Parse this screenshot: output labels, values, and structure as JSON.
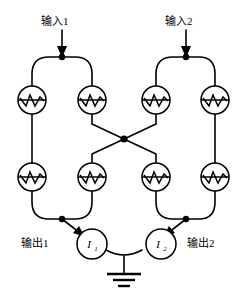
{
  "diagram": {
    "type": "circuit-schematic",
    "colors": {
      "wire": "#000000",
      "background": "#ffffff",
      "node": "#000000"
    },
    "inputs": [
      {
        "id": "input-1",
        "label": "输入1",
        "x": 90,
        "y": 25,
        "arrow_x": 62,
        "arrow_top": 30,
        "arrow_bottom": 56
      },
      {
        "id": "input-2",
        "label": "输入2",
        "x": 175,
        "y": 25,
        "arrow_x": 186,
        "arrow_top": 30,
        "arrow_bottom": 56
      }
    ],
    "outputs": [
      {
        "id": "output-1",
        "label": "输出1",
        "x": 22,
        "y": 236
      },
      {
        "id": "output-2",
        "label": "输出2",
        "x": 186,
        "y": 236
      }
    ],
    "current_sources": [
      {
        "id": "source-1",
        "symbol": "I",
        "subscript": "1",
        "cx": 92,
        "cy": 244,
        "r": 15
      },
      {
        "id": "source-2",
        "symbol": "I",
        "subscript": "2",
        "cx": 161,
        "cy": 244,
        "r": 15
      }
    ],
    "junctions": [
      {
        "id": "jj-1",
        "row": "upper",
        "loop": "left",
        "cx": 32,
        "cy": 100
      },
      {
        "id": "jj-2",
        "row": "upper",
        "loop": "left",
        "cx": 92,
        "cy": 100
      },
      {
        "id": "jj-3",
        "row": "upper",
        "loop": "right",
        "cx": 156,
        "cy": 100
      },
      {
        "id": "jj-4",
        "row": "upper",
        "loop": "right",
        "cx": 215,
        "cy": 100
      },
      {
        "id": "jj-5",
        "row": "lower",
        "loop": "left",
        "cx": 32,
        "cy": 177
      },
      {
        "id": "jj-6",
        "row": "lower",
        "loop": "left",
        "cx": 92,
        "cy": 177
      },
      {
        "id": "jj-7",
        "row": "lower",
        "loop": "right",
        "cx": 156,
        "cy": 177
      },
      {
        "id": "jj-8",
        "row": "lower",
        "loop": "right",
        "cx": 215,
        "cy": 177
      }
    ],
    "nodes": [
      {
        "id": "node-input-1",
        "x": 62,
        "y": 57
      },
      {
        "id": "node-input-2",
        "x": 186,
        "y": 57
      },
      {
        "id": "node-crossing",
        "x": 124,
        "y": 139
      },
      {
        "id": "node-output-1",
        "x": 62,
        "y": 219
      },
      {
        "id": "node-output-2",
        "x": 186,
        "y": 219
      }
    ],
    "ground": {
      "id": "ground-symbol",
      "x": 124,
      "top_y": 257,
      "bars": [
        {
          "half_width": 17,
          "y": 274,
          "thickness": 2.2
        },
        {
          "half_width": 11,
          "y": 280,
          "thickness": 2.2
        },
        {
          "half_width": 6,
          "y": 286,
          "thickness": 2.2
        }
      ]
    }
  }
}
